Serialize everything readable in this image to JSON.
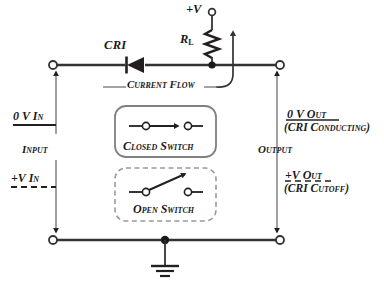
{
  "diagram": {
    "background": "#ffffff",
    "line_color": "#231f20",
    "accent_color": "#4d4d4d"
  },
  "labels": {
    "diode": "CRI",
    "supply": "+V",
    "load_resistor_main": "R",
    "load_resistor_sub": "L",
    "current_flow": "Current Flow",
    "input_zero_v": "0 V In",
    "input_name": "Input",
    "input_plus_v": "+V In",
    "output_name": "Output",
    "output_zero_v": "0 V Out",
    "output_zero_v_note": "(CRI Conducting)",
    "output_plus_v": "+V Out",
    "output_plus_v_note": "(CRI Cutoff)",
    "closed_switch": "Closed Switch",
    "open_switch": "Open Switch"
  },
  "icons": {
    "diode": "diode-symbol",
    "resistor": "resistor-zigzag",
    "ground": "ground-symbol",
    "terminal": "open-terminal-circle",
    "junction": "solid-junction-dot",
    "closed_switch": "closed-switch-symbol",
    "open_switch": "open-switch-symbol",
    "current_arrow": "curved-current-arrow"
  }
}
